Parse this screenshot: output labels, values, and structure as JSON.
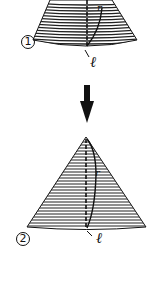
{
  "figure": {
    "stages": [
      {
        "marker": "1",
        "shape": "cone-frustum",
        "labels": {
          "radius": "r",
          "slant": "ℓ"
        }
      },
      {
        "marker": "2",
        "shape": "cone",
        "labels": {
          "radius": "r",
          "slant": "ℓ"
        }
      }
    ],
    "transition": {
      "icon": "arrow-down-icon"
    },
    "colors": {
      "ink": "#111111",
      "background": "#ffffff"
    }
  }
}
